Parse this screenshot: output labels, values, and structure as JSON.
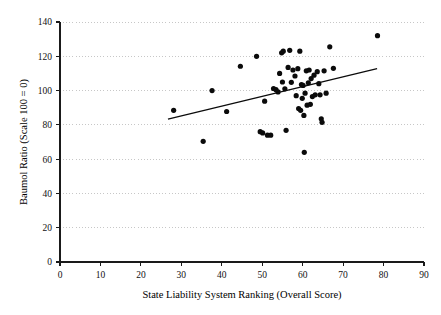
{
  "chart_data": {
    "type": "scatter",
    "title": "",
    "xlabel": "State Liability System Ranking (Overall Score)",
    "ylabel": "Baumol Ratio (Scale 100 = 0)",
    "xlim": [
      0,
      90
    ],
    "ylim": [
      0,
      140
    ],
    "xticks": [
      0,
      10,
      20,
      30,
      40,
      50,
      60,
      70,
      80,
      90
    ],
    "yticks": [
      0,
      20,
      40,
      60,
      80,
      100,
      120,
      140
    ],
    "grid": "horizontal-dotted",
    "legend": "none",
    "point_color": "#0b0b0b",
    "trend_line_color": "#0b0b0b",
    "trend_line": {
      "x_start": 26.7,
      "y_start": 83.3,
      "x_end": 78.4,
      "y_end": 112.8
    },
    "points": [
      {
        "x": 28.1,
        "y": 88.5
      },
      {
        "x": 35.4,
        "y": 70.4
      },
      {
        "x": 37.6,
        "y": 100.0
      },
      {
        "x": 41.2,
        "y": 87.8
      },
      {
        "x": 44.6,
        "y": 114.2
      },
      {
        "x": 48.6,
        "y": 120.0
      },
      {
        "x": 49.5,
        "y": 76.0
      },
      {
        "x": 50.1,
        "y": 75.3
      },
      {
        "x": 50.6,
        "y": 93.8
      },
      {
        "x": 51.3,
        "y": 74.0
      },
      {
        "x": 52.1,
        "y": 74.0
      },
      {
        "x": 52.8,
        "y": 101.2
      },
      {
        "x": 53.4,
        "y": 100.5
      },
      {
        "x": 53.9,
        "y": 99.2
      },
      {
        "x": 54.3,
        "y": 110.0
      },
      {
        "x": 54.8,
        "y": 122.0
      },
      {
        "x": 55.0,
        "y": 105.0
      },
      {
        "x": 55.2,
        "y": 123.0
      },
      {
        "x": 55.6,
        "y": 101.0
      },
      {
        "x": 55.9,
        "y": 76.8
      },
      {
        "x": 56.4,
        "y": 113.5
      },
      {
        "x": 56.8,
        "y": 123.5
      },
      {
        "x": 57.2,
        "y": 104.8
      },
      {
        "x": 57.6,
        "y": 112.0
      },
      {
        "x": 58.1,
        "y": 108.5
      },
      {
        "x": 58.4,
        "y": 97.0
      },
      {
        "x": 58.8,
        "y": 112.8
      },
      {
        "x": 59.0,
        "y": 89.5
      },
      {
        "x": 59.3,
        "y": 123.0
      },
      {
        "x": 59.5,
        "y": 88.5
      },
      {
        "x": 59.7,
        "y": 103.5
      },
      {
        "x": 59.9,
        "y": 95.5
      },
      {
        "x": 60.1,
        "y": 103.0
      },
      {
        "x": 60.3,
        "y": 85.5
      },
      {
        "x": 60.4,
        "y": 64.0
      },
      {
        "x": 60.6,
        "y": 98.5
      },
      {
        "x": 60.9,
        "y": 111.5
      },
      {
        "x": 61.1,
        "y": 91.5
      },
      {
        "x": 61.4,
        "y": 104.5
      },
      {
        "x": 61.6,
        "y": 112.0
      },
      {
        "x": 61.9,
        "y": 92.0
      },
      {
        "x": 62.1,
        "y": 107.0
      },
      {
        "x": 62.4,
        "y": 96.5
      },
      {
        "x": 62.8,
        "y": 109.0
      },
      {
        "x": 63.1,
        "y": 97.5
      },
      {
        "x": 63.6,
        "y": 111.0
      },
      {
        "x": 64.0,
        "y": 104.0
      },
      {
        "x": 64.3,
        "y": 97.5
      },
      {
        "x": 64.6,
        "y": 83.5
      },
      {
        "x": 64.8,
        "y": 81.5
      },
      {
        "x": 65.3,
        "y": 111.5
      },
      {
        "x": 65.8,
        "y": 98.5
      },
      {
        "x": 66.7,
        "y": 125.5
      },
      {
        "x": 67.6,
        "y": 113.0
      },
      {
        "x": 78.5,
        "y": 132.0
      }
    ]
  }
}
